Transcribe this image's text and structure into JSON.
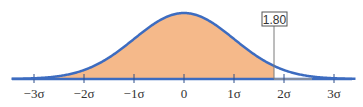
{
  "chart_data": {
    "type": "area",
    "title": "",
    "xlabel": "",
    "ylabel": "",
    "x_range": [
      -3.4,
      3.4
    ],
    "x_ticks": [
      -3,
      -2,
      -1,
      0,
      1,
      2,
      3
    ],
    "tick_labels": [
      "−3σ",
      "−2σ",
      "−1σ",
      "0",
      "1σ",
      "2σ",
      "3σ"
    ],
    "mean": 0,
    "sd": 1,
    "shaded_region": {
      "from": "-inf",
      "to": 1.8
    },
    "marker": {
      "x": 1.8,
      "label": "1.80"
    },
    "grid": false,
    "legend": null,
    "colors": {
      "curve": "#3d6cc0",
      "fill": "#f5b98a",
      "axis": "#3d6cc0",
      "axis_gray": "#9a9a9a",
      "marker_line": "#7a7a7a",
      "text": "#333333"
    }
  }
}
